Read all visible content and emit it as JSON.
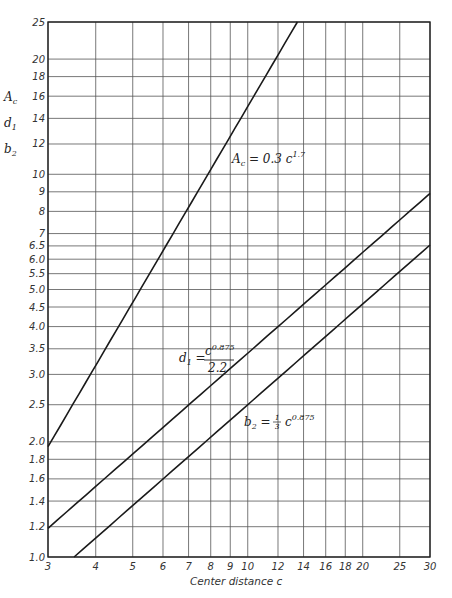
{
  "chart_data": {
    "type": "line",
    "title": "",
    "xlabel": "Center distance c",
    "ylabel_lines": [
      "A_c",
      "d_1",
      "b_2"
    ],
    "xscale": "log",
    "yscale": "log",
    "xlim": [
      3,
      30
    ],
    "ylim": [
      1.0,
      25
    ],
    "grid": true,
    "x_ticks": [
      3,
      4,
      5,
      6,
      7,
      8,
      9,
      10,
      12,
      14,
      16,
      18,
      20,
      25,
      30
    ],
    "x_tick_labels": [
      "3",
      "4",
      "5",
      "6",
      "7",
      "8",
      "9",
      "10",
      "12",
      "14",
      "16",
      "18",
      "20",
      "25",
      "30"
    ],
    "y_ticks": [
      1.0,
      1.2,
      1.4,
      1.6,
      1.8,
      2.0,
      2.5,
      3.0,
      3.5,
      4.0,
      4.5,
      5.0,
      5.5,
      6.0,
      6.5,
      7,
      8,
      9,
      10,
      12,
      14,
      16,
      18,
      20,
      25
    ],
    "y_tick_labels": [
      "1.0",
      "1.2",
      "1.4",
      "1.6",
      "1.8",
      "2.0",
      "2.5",
      "3.0",
      "3.5",
      "4.0",
      "4.5",
      "5.0",
      "5.5",
      "6.0",
      "6.5",
      "7",
      "8",
      "9",
      "10",
      "12",
      "14",
      "16",
      "18",
      "20",
      "25"
    ],
    "series": [
      {
        "name": "A_c = 0.3 c^1.7",
        "label_main": "A",
        "label_sub": "c",
        "label_rest": " = 0.3 c",
        "label_sup": "1.7",
        "coef": 0.3,
        "exp": 1.7,
        "divisor": 1,
        "x": [
          3,
          4,
          5,
          6,
          7,
          8,
          10,
          12.6
        ],
        "values": [
          1.94,
          3.15,
          4.63,
          6.32,
          8.23,
          10.34,
          15.04,
          22.3
        ]
      },
      {
        "name": "d_1 = c^0.875 / 2.2",
        "label_main": "d",
        "label_sub": "1",
        "label_num": "c",
        "label_sup": "0.875",
        "label_den": "2.2",
        "coef": 1,
        "exp": 0.875,
        "divisor": 2.2,
        "x": [
          3,
          4,
          5,
          6,
          8,
          10,
          12,
          16,
          20,
          25,
          30
        ],
        "values": [
          1.19,
          1.53,
          1.86,
          2.18,
          2.8,
          3.42,
          4.02,
          5.19,
          6.32,
          7.72,
          9.1
        ]
      },
      {
        "name": "b_2 = (1/3) c^0.875",
        "label_main": "b",
        "label_sub": "2",
        "label_frac_num": "1",
        "label_frac_den": "3",
        "label_base": "c",
        "label_sup": "0.875",
        "coef": 0.3333,
        "exp": 0.875,
        "divisor": 1,
        "x": [
          3.52,
          4,
          5,
          6,
          8,
          10,
          12,
          16,
          20,
          25,
          30
        ],
        "values": [
          1.0,
          1.12,
          1.36,
          1.6,
          2.06,
          2.5,
          2.95,
          3.8,
          4.63,
          5.66,
          6.67
        ]
      }
    ]
  }
}
